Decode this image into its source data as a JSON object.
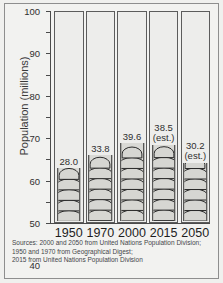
{
  "chart_data": {
    "type": "bar",
    "title": "",
    "xlabel": "",
    "ylabel": "Population (millions)",
    "categories": [
      "1950",
      "1970",
      "2000",
      "2015",
      "2050"
    ],
    "values": [
      28.0,
      33.8,
      39.6,
      38.5,
      30.2
    ],
    "value_labels": [
      "28.0",
      "33.8",
      "39.6",
      "38.5",
      "30.2"
    ],
    "value_sublabels": [
      "",
      "",
      "",
      "(est.)",
      "(est.)"
    ],
    "ylim": [
      0,
      100
    ],
    "yticks": [
      0,
      10,
      20,
      30,
      40,
      50,
      60,
      70,
      80,
      90,
      100
    ],
    "ytick_labels": [
      "0",
      "10",
      "20",
      "30",
      "40",
      "50",
      "60",
      "70",
      "80",
      "90",
      "100"
    ],
    "grid": false,
    "legend": "none",
    "bar_style": "pictorial-crowd-fill"
  },
  "sources": {
    "line1": "Sources: 2000 and 2050 from United Nations Population Division;",
    "line2": "1950 and 1970 from Geographical Digest;",
    "line3": "2015 from United Nations Population Division"
  },
  "colors": {
    "page_background": "#f0f0ee",
    "frame_border": "#8e8e8e",
    "axis": "#4a4a4a",
    "column_border": "#5c5c5c",
    "column_fill": "#ededeb",
    "bar_fill": "#d9d9d5",
    "bar_outline": "#2b2b2b",
    "text": "#2f2f2f",
    "sources_text": "#44464a"
  }
}
